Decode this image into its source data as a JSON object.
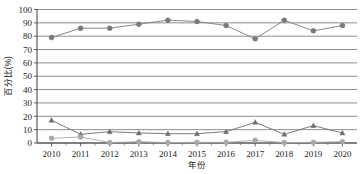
{
  "chart_data": {
    "type": "line",
    "title": "",
    "xlabel": "年份",
    "ylabel": "百分比(%)",
    "categories": [
      "2010",
      "2011",
      "2012",
      "2013",
      "2014",
      "2015",
      "2016",
      "2017",
      "2018",
      "2019",
      "2020"
    ],
    "ylim": [
      0,
      100
    ],
    "ytick_labels": [
      "0",
      "10",
      "20",
      "30",
      "40",
      "50",
      "60",
      "70",
      "80",
      "90",
      "100"
    ],
    "ytick_values": [
      0,
      10,
      20,
      30,
      40,
      50,
      60,
      70,
      80,
      90,
      100
    ],
    "grid": true,
    "legend": "none",
    "series": [
      {
        "name": "series-1",
        "marker": "circle",
        "color": "#7a7a7a",
        "values": [
          79,
          86,
          86,
          89,
          92,
          91,
          88,
          78,
          92,
          84,
          88
        ]
      },
      {
        "name": "series-2",
        "marker": "triangle",
        "color": "#6e6e6e",
        "values": [
          17,
          6.5,
          8.5,
          7.5,
          7,
          7,
          8.5,
          15.5,
          6.5,
          13,
          7.5
        ]
      },
      {
        "name": "series-3",
        "marker": "circle",
        "color": "#a8a8a8",
        "values": [
          3.5,
          4.5,
          0.3,
          1.0,
          0.3,
          0.5,
          0.5,
          2.0,
          0.3,
          0.5,
          1.0
        ]
      }
    ]
  }
}
